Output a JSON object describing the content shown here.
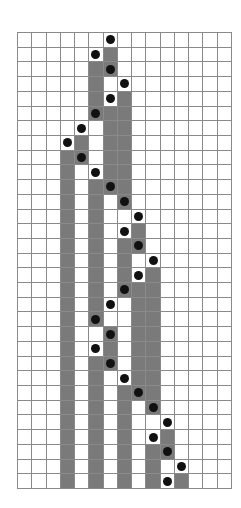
{
  "diagram": {
    "type": "grid-diagram",
    "columns": 15,
    "rows": 31,
    "legend": {
      ".": "empty cell",
      "S": "shaded cell",
      "D": "dot on white cell",
      "X": "dot on shaded cell"
    },
    "colors": {
      "grid_line": "#8a8a8a",
      "shaded": "#7a7a7a",
      "dot": "#111111",
      "background": "#ffffff"
    },
    "cells": [
      "......D........",
      ".....DS........",
      ".....SX........",
      ".....S.D.......",
      ".....SDS.......",
      ".....XSS.......",
      "....D.SS.......",
      "...DS.SS.......",
      "...SX.SS.......",
      "...S.DSS.......",
      "...S.SXS.......",
      "...S.S.X.......",
      "...S.S..D......",
      "...S.S.DS......",
      "...S.S.SX......",
      "...S.S.S.D.....",
      "...S.S.SDS.....",
      "...S.S.XSS.....",
      "...S.SD.SS.....",
      "...S.X..SS.....",
      "...S..X.SS.....",
      "...S.DS.SS.....",
      "...S.SX.SS.....",
      "...S.S.DSS.....",
      "...S.S.SXS.....",
      "...S.S.S.X.....",
      "...S.S.S..D....",
      "...S.S.S.DS....",
      "...S.S.S.SX....",
      "...S.S.S.S.D...",
      "...S.S.S.SDS..."
    ]
  }
}
